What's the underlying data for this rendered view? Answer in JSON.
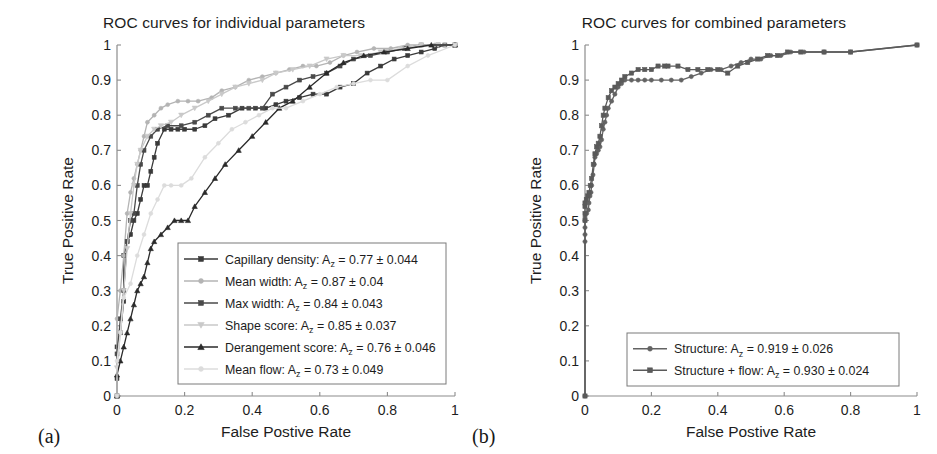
{
  "figure": {
    "panel_a_label": "(a)",
    "panel_b_label": "(b)",
    "axis_x_title": "False Postive Rate",
    "axis_y_title": "True Positive Rate"
  },
  "colors": {
    "axis": "#8c8c8c",
    "text": "#1d1d1d",
    "legend_border": "#7a7a7a",
    "capillary_density": "#3a3a3a",
    "mean_width": "#b4b4b4",
    "max_width": "#4a4a4a",
    "shape_score": "#c9c9c9",
    "derangement_score": "#2a2a2a",
    "mean_flow": "#dcdcdc",
    "structure": "#636363",
    "structure_flow": "#5a5a5a"
  },
  "chart_data": [
    {
      "type": "line",
      "panel": "a",
      "title": "ROC curves for individual parameters",
      "xlabel": "False Postive Rate",
      "ylabel": "True Positive Rate",
      "xlim": [
        0,
        1
      ],
      "ylim": [
        0,
        1
      ],
      "xticks": [
        "0",
        "0.2",
        "0.4",
        "0.6",
        "0.8",
        "1"
      ],
      "xtick_values": [
        0,
        0.2,
        0.4,
        0.6,
        0.8,
        1
      ],
      "yticks": [
        "0",
        "0.1",
        "0.2",
        "0.3",
        "0.4",
        "0.5",
        "0.6",
        "0.7",
        "0.8",
        "0.9",
        "1"
      ],
      "ytick_values": [
        0,
        0.1,
        0.2,
        0.3,
        0.4,
        0.5,
        0.6,
        0.7,
        0.8,
        0.9,
        1.0
      ],
      "grid": false,
      "legend_position": "lower-right-inside",
      "series": [
        {
          "name": "Capillary density",
          "label": "Capillary density: A",
          "label_sub": "z",
          "label_tail": " = 0.77 ± 0.044",
          "az": 0.77,
          "az_err": 0.044,
          "marker": "square",
          "color": "#3a3a3a",
          "x": [
            0,
            0,
            0,
            0.01,
            0.02,
            0.02,
            0.03,
            0.04,
            0.05,
            0.06,
            0.07,
            0.08,
            0.09,
            0.1,
            0.11,
            0.12,
            0.14,
            0.16,
            0.18,
            0.2,
            0.23,
            0.26,
            0.29,
            0.33,
            0.37,
            0.41,
            0.44,
            0.47,
            0.5,
            0.54,
            0.58,
            0.62,
            0.66,
            0.7,
            0.74,
            0.78,
            0.82,
            0.86,
            0.9,
            0.94,
            0.97,
            1.0
          ],
          "y": [
            0,
            0.05,
            0.14,
            0.18,
            0.27,
            0.4,
            0.44,
            0.46,
            0.5,
            0.52,
            0.56,
            0.6,
            0.6,
            0.64,
            0.68,
            0.72,
            0.76,
            0.76,
            0.76,
            0.76,
            0.76,
            0.77,
            0.79,
            0.8,
            0.82,
            0.82,
            0.82,
            0.83,
            0.84,
            0.85,
            0.86,
            0.86,
            0.88,
            0.89,
            0.92,
            0.94,
            0.96,
            0.97,
            0.98,
            0.99,
            1.0,
            1.0
          ]
        },
        {
          "name": "Mean width",
          "label": "Mean width: A",
          "label_sub": "z",
          "label_tail": " = 0.87 ± 0.04",
          "az": 0.87,
          "az_err": 0.04,
          "marker": "circle",
          "color": "#b4b4b4",
          "x": [
            0,
            0,
            0.01,
            0.02,
            0.03,
            0.04,
            0.05,
            0.06,
            0.07,
            0.08,
            0.09,
            0.11,
            0.13,
            0.15,
            0.18,
            0.21,
            0.24,
            0.28,
            0.31,
            0.35,
            0.39,
            0.43,
            0.47,
            0.51,
            0.55,
            0.59,
            0.63,
            0.67,
            0.71,
            0.76,
            0.81,
            0.86,
            0.9,
            0.94,
            0.97,
            1.0
          ],
          "y": [
            0,
            0.22,
            0.3,
            0.4,
            0.52,
            0.58,
            0.62,
            0.66,
            0.7,
            0.74,
            0.78,
            0.8,
            0.82,
            0.83,
            0.84,
            0.84,
            0.84,
            0.85,
            0.87,
            0.88,
            0.9,
            0.91,
            0.92,
            0.93,
            0.94,
            0.94,
            0.95,
            0.97,
            0.98,
            0.99,
            0.99,
            1.0,
            1.0,
            1.0,
            1.0,
            1.0
          ]
        },
        {
          "name": "Max width",
          "label": "Max width: A",
          "label_sub": "z",
          "label_tail": " = 0.84 ± 0.043",
          "az": 0.84,
          "az_err": 0.043,
          "marker": "square",
          "color": "#4a4a4a",
          "x": [
            0,
            0,
            0.01,
            0.02,
            0.03,
            0.04,
            0.05,
            0.06,
            0.07,
            0.08,
            0.1,
            0.12,
            0.15,
            0.19,
            0.23,
            0.27,
            0.31,
            0.35,
            0.39,
            0.43,
            0.46,
            0.5,
            0.54,
            0.58,
            0.62,
            0.66,
            0.7,
            0.75,
            0.8,
            0.85,
            0.9,
            0.95,
            1.0
          ],
          "y": [
            0,
            0.12,
            0.22,
            0.3,
            0.44,
            0.5,
            0.52,
            0.6,
            0.66,
            0.7,
            0.74,
            0.76,
            0.77,
            0.77,
            0.78,
            0.8,
            0.82,
            0.82,
            0.82,
            0.82,
            0.86,
            0.88,
            0.9,
            0.91,
            0.92,
            0.94,
            0.96,
            0.97,
            0.98,
            0.99,
            1.0,
            1.0,
            1.0
          ]
        },
        {
          "name": "Shape score",
          "label": "Shape score: A",
          "label_sub": "z",
          "label_tail": " = 0.85 ± 0.037",
          "az": 0.85,
          "az_err": 0.037,
          "marker": "triangle-down",
          "color": "#c9c9c9",
          "x": [
            0,
            0,
            0.01,
            0.02,
            0.03,
            0.04,
            0.05,
            0.06,
            0.07,
            0.09,
            0.11,
            0.13,
            0.16,
            0.19,
            0.23,
            0.27,
            0.31,
            0.35,
            0.39,
            0.43,
            0.47,
            0.52,
            0.57,
            0.62,
            0.67,
            0.72,
            0.78,
            0.84,
            0.9,
            0.95,
            1.0
          ],
          "y": [
            0,
            0.08,
            0.18,
            0.3,
            0.42,
            0.52,
            0.6,
            0.66,
            0.7,
            0.74,
            0.76,
            0.77,
            0.78,
            0.8,
            0.82,
            0.84,
            0.86,
            0.88,
            0.89,
            0.9,
            0.92,
            0.93,
            0.94,
            0.96,
            0.97,
            0.97,
            0.98,
            0.99,
            1.0,
            1.0,
            1.0
          ]
        },
        {
          "name": "Derangement score",
          "label": "Derangement score: A",
          "label_sub": "z",
          "label_tail": " = 0.76 ± 0.046",
          "az": 0.76,
          "az_err": 0.046,
          "marker": "triangle-up",
          "color": "#2a2a2a",
          "x": [
            0,
            0,
            0.01,
            0.02,
            0.03,
            0.04,
            0.05,
            0.06,
            0.07,
            0.08,
            0.09,
            0.1,
            0.11,
            0.13,
            0.15,
            0.17,
            0.19,
            0.21,
            0.23,
            0.26,
            0.29,
            0.32,
            0.36,
            0.4,
            0.44,
            0.48,
            0.52,
            0.57,
            0.62,
            0.67,
            0.73,
            0.79,
            0.86,
            0.93,
            1.0
          ],
          "y": [
            0,
            0.06,
            0.1,
            0.14,
            0.18,
            0.22,
            0.26,
            0.3,
            0.32,
            0.34,
            0.38,
            0.42,
            0.44,
            0.46,
            0.48,
            0.5,
            0.5,
            0.5,
            0.54,
            0.58,
            0.62,
            0.66,
            0.7,
            0.74,
            0.78,
            0.82,
            0.84,
            0.88,
            0.92,
            0.95,
            0.97,
            0.98,
            0.99,
            1.0,
            1.0
          ]
        },
        {
          "name": "Mean flow",
          "label": "Mean flow: A",
          "label_sub": "z",
          "label_tail": " = 0.73 ± 0.049",
          "az": 0.73,
          "az_err": 0.049,
          "marker": "circle",
          "color": "#dcdcdc",
          "x": [
            0,
            0,
            0.01,
            0.02,
            0.04,
            0.06,
            0.08,
            0.1,
            0.12,
            0.14,
            0.16,
            0.19,
            0.22,
            0.26,
            0.3,
            0.34,
            0.38,
            0.42,
            0.46,
            0.5,
            0.55,
            0.6,
            0.65,
            0.7,
            0.75,
            0.8,
            0.86,
            0.92,
            1.0
          ],
          "y": [
            0,
            0.1,
            0.18,
            0.28,
            0.32,
            0.4,
            0.46,
            0.52,
            0.56,
            0.6,
            0.6,
            0.6,
            0.62,
            0.68,
            0.72,
            0.76,
            0.78,
            0.8,
            0.82,
            0.82,
            0.84,
            0.86,
            0.88,
            0.89,
            0.9,
            0.9,
            0.94,
            0.97,
            1.0
          ]
        }
      ]
    },
    {
      "type": "line",
      "panel": "b",
      "title": "ROC curves for combined parameters",
      "xlabel": "False Postive Rate",
      "ylabel": "True Positive Rate",
      "xlim": [
        0,
        1
      ],
      "ylim": [
        0,
        1
      ],
      "xticks": [
        "0",
        "0.2",
        "0.4",
        "0.6",
        "0.8",
        "1"
      ],
      "xtick_values": [
        0,
        0.2,
        0.4,
        0.6,
        0.8,
        1
      ],
      "yticks": [
        "0",
        "0.1",
        "0.2",
        "0.3",
        "0.4",
        "0.5",
        "0.6",
        "0.7",
        "0.8",
        "0.9",
        "1"
      ],
      "ytick_values": [
        0,
        0.1,
        0.2,
        0.3,
        0.4,
        0.5,
        0.6,
        0.7,
        0.8,
        0.9,
        1.0
      ],
      "grid": false,
      "legend_position": "lower-right-inside",
      "series": [
        {
          "name": "Structure",
          "label": "Structure: A",
          "label_sub": "z",
          "label_tail": " = 0.919 ± 0.026",
          "az": 0.919,
          "az_err": 0.026,
          "marker": "circle",
          "color": "#636363",
          "x": [
            0,
            0,
            0,
            0,
            0,
            0,
            0.005,
            0.01,
            0.012,
            0.015,
            0.018,
            0.02,
            0.024,
            0.028,
            0.03,
            0.035,
            0.04,
            0.045,
            0.05,
            0.055,
            0.06,
            0.065,
            0.07,
            0.08,
            0.09,
            0.1,
            0.11,
            0.12,
            0.14,
            0.16,
            0.18,
            0.2,
            0.23,
            0.26,
            0.29,
            0.32,
            0.35,
            0.38,
            0.41,
            0.44,
            0.47,
            0.5,
            0.53,
            0.56,
            0.59,
            0.62,
            0.66,
            0.72,
            0.8,
            1.0
          ],
          "y": [
            0,
            0.44,
            0.46,
            0.48,
            0.5,
            0.51,
            0.52,
            0.53,
            0.55,
            0.57,
            0.58,
            0.6,
            0.63,
            0.66,
            0.68,
            0.69,
            0.7,
            0.71,
            0.73,
            0.76,
            0.78,
            0.8,
            0.82,
            0.84,
            0.86,
            0.88,
            0.89,
            0.9,
            0.9,
            0.9,
            0.9,
            0.9,
            0.9,
            0.9,
            0.9,
            0.91,
            0.92,
            0.93,
            0.93,
            0.94,
            0.95,
            0.96,
            0.96,
            0.97,
            0.97,
            0.98,
            0.98,
            0.98,
            0.98,
            1.0
          ]
        },
        {
          "name": "Structure + flow",
          "label": "Structure + flow: A",
          "label_sub": "z",
          "label_tail": " = 0.930 ± 0.024",
          "az": 0.93,
          "az_err": 0.024,
          "marker": "square",
          "color": "#5a5a5a",
          "x": [
            0,
            0,
            0,
            0,
            0,
            0.004,
            0.008,
            0.012,
            0.016,
            0.02,
            0.025,
            0.03,
            0.035,
            0.04,
            0.045,
            0.05,
            0.055,
            0.06,
            0.07,
            0.08,
            0.09,
            0.1,
            0.11,
            0.12,
            0.14,
            0.16,
            0.18,
            0.2,
            0.22,
            0.24,
            0.25,
            0.28,
            0.31,
            0.34,
            0.37,
            0.4,
            0.43,
            0.46,
            0.49,
            0.52,
            0.55,
            0.58,
            0.61,
            0.65,
            0.72,
            0.8,
            1.0
          ],
          "y": [
            0,
            0.5,
            0.52,
            0.54,
            0.55,
            0.56,
            0.57,
            0.58,
            0.6,
            0.62,
            0.66,
            0.69,
            0.71,
            0.72,
            0.74,
            0.77,
            0.8,
            0.82,
            0.85,
            0.87,
            0.88,
            0.89,
            0.9,
            0.91,
            0.92,
            0.93,
            0.93,
            0.93,
            0.94,
            0.94,
            0.94,
            0.94,
            0.93,
            0.93,
            0.93,
            0.93,
            0.92,
            0.94,
            0.95,
            0.96,
            0.97,
            0.97,
            0.98,
            0.98,
            0.98,
            0.98,
            1.0
          ]
        }
      ]
    }
  ]
}
